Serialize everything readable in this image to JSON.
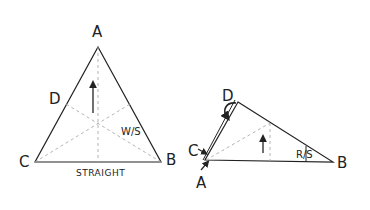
{
  "left_figure": {
    "vertices": {
      "A": [
        98,
        47
      ],
      "B": [
        161,
        162
      ],
      "C": [
        35,
        162
      ]
    },
    "labels": {
      "A": "A",
      "B": "B",
      "C": "C",
      "D": "D",
      "ws": "W/S",
      "base": "STRAIGHT"
    },
    "arrow": "up-arrow"
  },
  "right_figure": {
    "vertices": {
      "D": [
        238,
        102
      ],
      "AC": [
        205,
        160
      ],
      "B": [
        333,
        162
      ]
    },
    "labels": {
      "D": "D",
      "C": "C",
      "A": "A",
      "B": "B",
      "rs": "R/S"
    },
    "arrow": "up-arrow",
    "fold_arrow": "curved-arrow"
  },
  "colors": {
    "line": "#222222",
    "dashed": "#aaaaaa",
    "background": "#ffffff"
  }
}
